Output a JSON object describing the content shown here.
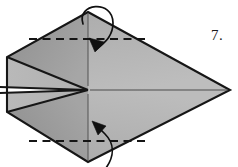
{
  "figure": {
    "kind": "origami-fold-diagram",
    "step_number_label": "7."
  },
  "colors": {
    "paper_light": "#bcbcbc",
    "paper_mid": "#b0b0b0",
    "paper_dark": "#9a9a9a",
    "paper_darker": "#8e8e8e",
    "outline": "#161616",
    "crease": "#2a2a2a",
    "dashed": "#1a1a1a",
    "arrow": "#111111",
    "background": "#ffffff",
    "text": "#1a1a1a"
  },
  "shape": {
    "outline_points": "88,12 230,90 88,162 7,112 7,57",
    "top_vertex": "88,12",
    "right_tip": "230,90",
    "bottom_vertex": "88,162",
    "left_top_corner": "7,57",
    "left_bottom_corner": "7,112",
    "center_point": "88,90"
  },
  "facets": [
    {
      "name": "upper-right-panel",
      "points": "88,12 230,90 88,90",
      "fill": "#b6b6b6"
    },
    {
      "name": "lower-right-panel",
      "points": "88,90 230,90 88,162",
      "fill": "#b2b2b2"
    },
    {
      "name": "upper-left-outer-flap",
      "points": "88,12 88,90 7,57 7,45",
      "fill": "#9c9c9c"
    },
    {
      "name": "upper-left-inner-flap",
      "points": "7,57 88,90 7,88",
      "fill": "#b4b4b4"
    },
    {
      "name": "lower-left-inner-flap",
      "points": "7,92 88,90 7,112",
      "fill": "#b4b4b4"
    },
    {
      "name": "lower-left-outer-flap",
      "points": "88,90 88,162 7,125 7,112",
      "fill": "#9a9a9a"
    }
  ],
  "creases": [
    {
      "name": "vertical-crease-upper",
      "x1": 88,
      "y1": 14,
      "x2": 88,
      "y2": 88
    },
    {
      "name": "vertical-crease-lower",
      "x1": 88,
      "y1": 92,
      "x2": 88,
      "y2": 160
    },
    {
      "name": "horizontal-center-crease",
      "x1": 88,
      "y1": 90,
      "x2": 228,
      "y2": 90
    },
    {
      "name": "left-horizontal-crease-upper",
      "x1": 1,
      "y1": 88,
      "x2": 88,
      "y2": 90
    },
    {
      "name": "left-horizontal-crease-lower",
      "x1": 1,
      "y1": 92,
      "x2": 88,
      "y2": 90
    },
    {
      "name": "upper-flap-fold-edge",
      "x1": 7,
      "y1": 57,
      "x2": 88,
      "y2": 90
    },
    {
      "name": "lower-flap-fold-edge",
      "x1": 7,
      "y1": 112,
      "x2": 88,
      "y2": 90
    }
  ],
  "fold_lines": [
    {
      "name": "top-valley-fold-line",
      "style": "dashed",
      "x1": 29,
      "y1": 39,
      "x2": 146,
      "y2": 39,
      "dash": "7,5"
    },
    {
      "name": "bottom-valley-fold-line",
      "style": "dashed",
      "x1": 29,
      "y1": 141,
      "x2": 146,
      "y2": 141,
      "dash": "7,5"
    }
  ],
  "arrows": [
    {
      "name": "top-fold-arrow",
      "direction": "fold-down",
      "path": "M 84,22 C 78,2 112,0 112,22 C 112,38 102,44 95,50",
      "head_points": "95,51 90,38 104,41"
    },
    {
      "name": "bottom-fold-arrow",
      "direction": "fold-up",
      "path": "M 104,167 C 112,154 112,144 104,135 C 99,130 96,127 93,123",
      "head_points": "92,122 97,135 105,126"
    }
  ]
}
